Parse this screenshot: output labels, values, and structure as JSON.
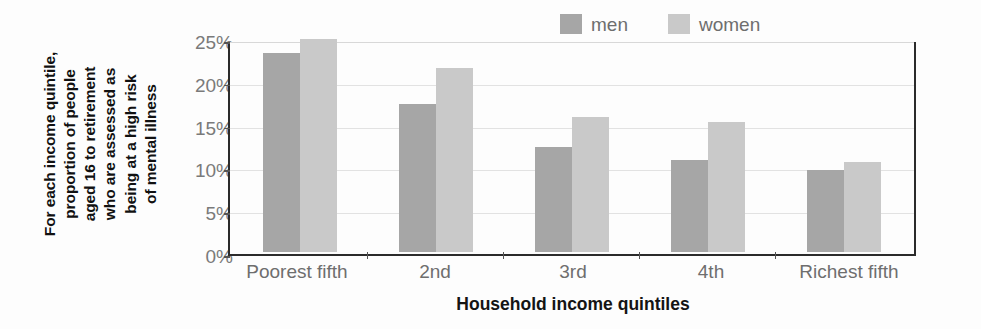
{
  "chart_data": {
    "type": "bar",
    "title": "",
    "subtitle": "",
    "categories": [
      "Poorest fifth",
      "2nd",
      "3rd",
      "4th",
      "Richest fifth"
    ],
    "series": [
      {
        "name": "men",
        "color": "#a6a6a6",
        "values": [
          23.2,
          17.3,
          12.3,
          10.7,
          9.6
        ]
      },
      {
        "name": "women",
        "color": "#c9c9c9",
        "values": [
          24.9,
          21.5,
          15.8,
          15.2,
          10.5
        ]
      }
    ],
    "xlabel": "Household income quintiles",
    "ylabel": "For each income quintile, proportion of people aged 16 to retirement who are assessed as being at a high risk of mental illness",
    "ylabel_lines": "For each income quintile,\nproportion of people\naged 16 to retirement\nwho are assessed as\nbeing at a high risk\nof mental illness",
    "ylim": [
      0,
      25
    ],
    "ytick_values": [
      0,
      5,
      10,
      15,
      20,
      25
    ],
    "ytick_labels": [
      "0%",
      "5%",
      "10%",
      "15%",
      "20%",
      "25%"
    ],
    "grid": true,
    "legend_position": "top-right",
    "value_suffix": "%"
  },
  "legend": {
    "items": [
      {
        "label": "men",
        "color": "#a6a6a6"
      },
      {
        "label": "women",
        "color": "#c9c9c9"
      }
    ]
  },
  "axis": {
    "x_title": "Household income quintiles",
    "y_caption": "For each income quintile,\nproportion of people\naged 16 to retirement\nwho are assessed as\nbeing at a high risk\nof mental illness"
  },
  "colors": {
    "men": "#a6a6a6",
    "women": "#c9c9c9",
    "axis": "#2b2b2b",
    "grid": "#e2e2e2",
    "tick_text": "#7a7a7a",
    "title_text": "#141414",
    "background": "#fdfdfd"
  }
}
